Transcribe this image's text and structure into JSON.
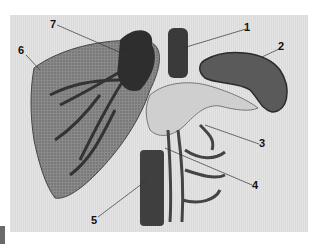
{
  "figure": {
    "labels": [
      {
        "id": "1",
        "text": "1",
        "x": 244,
        "y": 22
      },
      {
        "id": "2",
        "text": "2",
        "x": 278,
        "y": 41
      },
      {
        "id": "3",
        "text": "3",
        "x": 259,
        "y": 138
      },
      {
        "id": "4",
        "text": "4",
        "x": 252,
        "y": 180
      },
      {
        "id": "5",
        "text": "5",
        "x": 91,
        "y": 215
      },
      {
        "id": "6",
        "text": "6",
        "x": 18,
        "y": 45
      },
      {
        "id": "7",
        "text": "7",
        "x": 50,
        "y": 19
      }
    ]
  }
}
